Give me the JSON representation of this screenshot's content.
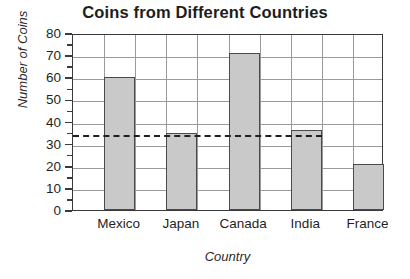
{
  "chart_data": {
    "type": "bar",
    "title": "Coins from Different Countries",
    "xlabel": "Country",
    "ylabel": "Number of Coins",
    "categories": [
      "Mexico",
      "Japan",
      "Canada",
      "India",
      "France"
    ],
    "values": [
      60,
      35,
      71,
      36,
      21
    ],
    "ylim": [
      0,
      80
    ],
    "ytick_labels": [
      "0",
      "10",
      "20",
      "30",
      "40",
      "50",
      "60",
      "70",
      "80"
    ],
    "ytick_values": [
      0,
      10,
      20,
      30,
      40,
      50,
      60,
      70,
      80
    ],
    "ytick_step": 10,
    "minor_tick_step": 5,
    "grid": true,
    "grid_axis": "both",
    "legend": "none",
    "annotations": [
      {
        "name": "mean-line",
        "type": "horizontal-dashed-line",
        "value": 35,
        "label": "",
        "extends_to_category": "India"
      }
    ],
    "bar_fill_color": "#c9c9c9",
    "bar_border_color": "#4a4a4a",
    "grid_color": "#9a9a9a",
    "frame_color": "#3a3a3a",
    "background_color": "#ffffff",
    "text_color": "#1f1f1f"
  }
}
